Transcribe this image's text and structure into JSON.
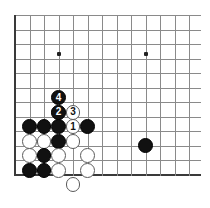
{
  "diagram": {
    "kind": "go-board-diagram",
    "board": {
      "origin_x": 15,
      "origin_y": 15,
      "spacing": 14.5,
      "cols": 13,
      "rows": 12,
      "left_edge_col": 0,
      "bottom_edge_row": 11,
      "stone_radius": 7.4,
      "grid_color": "#8a8a8a",
      "edge_color": "#3a3a3a",
      "background": "#ffffff"
    },
    "star_points": [
      {
        "name": "star-point-left",
        "col": 3,
        "row": 2.7
      },
      {
        "name": "star-point-right",
        "col": 9,
        "row": 2.7
      }
    ],
    "stones": [
      {
        "name": "white-stone-a",
        "color": "white",
        "label": "",
        "col": 3,
        "row": 6.7
      },
      {
        "name": "black-move-4",
        "color": "black",
        "label": "4",
        "col": 3,
        "row": 5.7
      },
      {
        "name": "black-move-2",
        "color": "black",
        "label": "2",
        "col": 3,
        "row": 6.7
      },
      {
        "name": "white-move-3",
        "color": "white",
        "label": "3",
        "col": 4,
        "row": 6.7
      },
      {
        "name": "white-move-1",
        "color": "white",
        "label": "1",
        "col": 4,
        "row": 7.7
      },
      {
        "name": "black-stone-b",
        "color": "black",
        "label": "",
        "col": 1,
        "row": 7.7
      },
      {
        "name": "black-stone-c",
        "color": "black",
        "label": "",
        "col": 2,
        "row": 7.7
      },
      {
        "name": "black-stone-d",
        "color": "black",
        "label": "",
        "col": 3,
        "row": 7.7
      },
      {
        "name": "black-stone-e",
        "color": "black",
        "label": "",
        "col": 5,
        "row": 7.7
      },
      {
        "name": "white-stone-f",
        "color": "white",
        "label": "",
        "col": 1,
        "row": 8.7
      },
      {
        "name": "white-stone-g",
        "color": "white",
        "label": "",
        "col": 2,
        "row": 8.7
      },
      {
        "name": "black-stone-h",
        "color": "black",
        "label": "",
        "col": 3,
        "row": 8.7
      },
      {
        "name": "white-stone-i",
        "color": "white",
        "label": "",
        "col": 4,
        "row": 8.7
      },
      {
        "name": "white-stone-j",
        "color": "white",
        "label": "",
        "col": 1,
        "row": 9.7
      },
      {
        "name": "black-stone-k",
        "color": "black",
        "label": "",
        "col": 2,
        "row": 9.7
      },
      {
        "name": "white-stone-l",
        "color": "white",
        "label": "",
        "col": 3,
        "row": 9.7
      },
      {
        "name": "white-stone-m",
        "color": "white",
        "label": "",
        "col": 5,
        "row": 9.7
      },
      {
        "name": "black-stone-n",
        "color": "black",
        "label": "",
        "col": 1,
        "row": 10.7
      },
      {
        "name": "black-stone-o",
        "color": "black",
        "label": "",
        "col": 2,
        "row": 10.7
      },
      {
        "name": "white-stone-p",
        "color": "white",
        "label": "",
        "col": 3,
        "row": 10.7
      },
      {
        "name": "white-stone-q",
        "color": "white",
        "label": "",
        "col": 5,
        "row": 10.7
      },
      {
        "name": "white-stone-r",
        "color": "white",
        "label": "",
        "col": 4,
        "row": 11.7
      },
      {
        "name": "black-stone-lone",
        "color": "black",
        "label": "",
        "col": 9,
        "row": 9.0
      }
    ]
  }
}
